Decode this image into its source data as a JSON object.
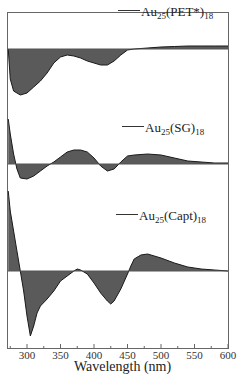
{
  "chart_data": {
    "type": "area",
    "title": "",
    "xlabel": "Wavelength (nm)",
    "ylabel": "",
    "xlim": [
      272,
      600
    ],
    "xticks": [
      300,
      350,
      400,
      450,
      500,
      550,
      600
    ],
    "grid": false,
    "legend_position": "inline labels above each trace",
    "fill_color": "#5a5a5a",
    "line_color": "#1a1a1a",
    "note": "Stacked CD spectra with offset baselines; y values are relative (arbitrary units, positive=above baseline).",
    "series": [
      {
        "name": "Au25(PET*)18",
        "label_main": "Au",
        "label_sub1": "25",
        "label_mid": "(PET*)",
        "label_sub2": "18",
        "x": [
          272,
          275,
          280,
          290,
          300,
          310,
          320,
          330,
          340,
          350,
          360,
          370,
          380,
          390,
          400,
          410,
          420,
          430,
          440,
          450,
          460,
          480,
          500,
          520,
          540,
          560,
          580,
          600
        ],
        "y": [
          0,
          -30,
          -42,
          -46,
          -44,
          -38,
          -32,
          -24,
          -14,
          -8,
          -6,
          -7,
          -9,
          -12,
          -14,
          -16,
          -16,
          -12,
          -6,
          -1,
          0,
          1,
          2,
          2.5,
          3,
          3,
          3,
          3
        ]
      },
      {
        "name": "Au25(SG)18",
        "label_main": "Au",
        "label_sub1": "25",
        "label_mid": "(SG)",
        "label_sub2": "18",
        "x": [
          272,
          275,
          280,
          285,
          290,
          300,
          310,
          320,
          330,
          340,
          350,
          360,
          370,
          380,
          390,
          400,
          410,
          420,
          430,
          440,
          450,
          460,
          480,
          500,
          520,
          540,
          560,
          580,
          600
        ],
        "y": [
          45,
          30,
          10,
          -5,
          -14,
          -15,
          -12,
          -7,
          -2,
          2,
          7,
          12,
          14,
          14,
          12,
          6,
          -2,
          -7,
          -5,
          2,
          8,
          9,
          10,
          9,
          6,
          3,
          2,
          1,
          1
        ]
      },
      {
        "name": "Au25(Capt)18",
        "label_main": "Au",
        "label_sub1": "25",
        "label_mid": "(Capt)",
        "label_sub2": "18",
        "x": [
          272,
          275,
          280,
          285,
          290,
          295,
          300,
          305,
          310,
          315,
          320,
          330,
          340,
          350,
          360,
          370,
          375,
          380,
          390,
          400,
          410,
          420,
          425,
          430,
          440,
          450,
          455,
          460,
          470,
          480,
          500,
          520,
          540,
          560,
          580,
          600
        ],
        "y": [
          80,
          60,
          40,
          20,
          0,
          -20,
          -45,
          -65,
          -55,
          -42,
          -35,
          -28,
          -20,
          -10,
          -5,
          0,
          2,
          1,
          -3,
          -12,
          -22,
          -30,
          -33,
          -30,
          -18,
          -3,
          5,
          12,
          16,
          17,
          13,
          8,
          4,
          2,
          1,
          0
        ]
      }
    ]
  }
}
